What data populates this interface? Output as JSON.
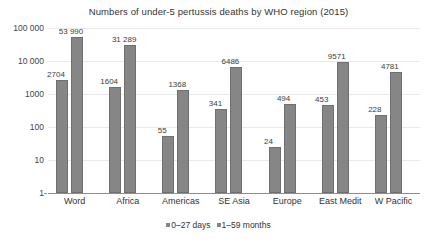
{
  "chart_data": {
    "type": "bar",
    "title": "Numbers of under-5 pertussis deaths by WHO region (2015)",
    "xlabel": "",
    "ylabel": "",
    "yscale": "log",
    "ylim": [
      1,
      100000
    ],
    "ytick_labels": [
      "1",
      "10",
      "100",
      "1000",
      "10 000",
      "100 000"
    ],
    "ytick_values": [
      1,
      10,
      100,
      1000,
      10000,
      100000
    ],
    "grid": true,
    "legend_position": "bottom",
    "categories": [
      "Word",
      "Africa",
      "Americas",
      "SE Asia",
      "Europe",
      "East Medit",
      "W Pacific"
    ],
    "series": [
      {
        "name": "0–27 days",
        "color": "#868686",
        "values": [
          2704,
          1604,
          55,
          341,
          24,
          453,
          228
        ],
        "value_labels": [
          "2704",
          "1604",
          "55",
          "341",
          "24",
          "453",
          "228"
        ]
      },
      {
        "name": "1–59 months",
        "color": "#868686",
        "values": [
          53990,
          31289,
          1368,
          6486,
          494,
          9571,
          4781
        ],
        "value_labels": [
          "53 990",
          "31 289",
          "1368",
          "6486",
          "494",
          "9571",
          "4781"
        ]
      }
    ]
  },
  "colors": {
    "bar_fill": "#868686",
    "bar_stroke": "#6f6f6f",
    "gridline": "#e9e9e9",
    "axis": "#8d8d8d",
    "text": "#333333",
    "background": "#ffffff"
  }
}
